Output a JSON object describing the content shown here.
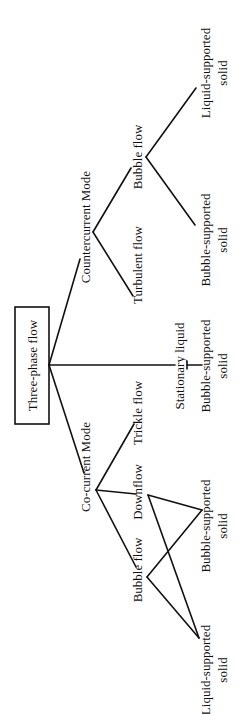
{
  "diagram": {
    "orientation": "rotated-90-ccw",
    "root": {
      "label": "Three-phase flow"
    },
    "branches": {
      "countercurrent": {
        "label": "Countercurrent Mode",
        "children": {
          "turbulent": {
            "label": "Turbulent flow"
          },
          "bubble": {
            "label": "Bubble flow",
            "children": {
              "bubble_supported": {
                "line1": "Bubble-supported",
                "line2": "solid"
              },
              "liquid_supported": {
                "line1": "Liquid-supported",
                "line2": "solid"
              }
            }
          }
        }
      },
      "stationary": {
        "label": "Stationary liquid",
        "children": {
          "bubble_supported": {
            "line1": "Bubble-supported",
            "line2": "solid"
          }
        }
      },
      "cocurrent": {
        "label": "Co-current Mode",
        "children": {
          "trickle": {
            "label": "Trickle flow"
          },
          "downflow": {
            "label": "Downflow"
          },
          "bubble": {
            "label": "Bubble flow"
          },
          "shared_bubble_supported": {
            "line1": "Bubble-supported",
            "line2": "solid"
          },
          "shared_liquid_supported": {
            "line1": "Liquid-supported",
            "line2": "solid"
          }
        }
      }
    },
    "colors": {
      "line": "#111111",
      "background": "#ffffff"
    }
  }
}
